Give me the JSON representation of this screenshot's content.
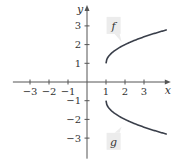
{
  "chart_data": {
    "type": "line",
    "title": "",
    "xlabel": "x",
    "ylabel": "y",
    "xlim": [
      -3.9,
      4.2
    ],
    "ylim": [
      -4.1,
      3.9
    ],
    "grid": false,
    "x_ticks": [
      -3,
      -2,
      -1,
      1,
      2,
      3
    ],
    "y_ticks": [
      3,
      2,
      1,
      -1,
      -2,
      -3
    ],
    "series": [
      {
        "name": "f",
        "formula": "1 + sqrt(x - 1)",
        "x": [
          1,
          1.1,
          1.25,
          1.5,
          2,
          2.5,
          3,
          3.5,
          4.2
        ],
        "values": [
          1,
          1.316,
          1.5,
          1.707,
          2,
          2.225,
          2.414,
          2.581,
          2.789
        ],
        "label_at": [
          1.4,
          3.0
        ]
      },
      {
        "name": "g",
        "formula": "-1 - sqrt(x - 1)",
        "x": [
          1,
          1.1,
          1.25,
          1.5,
          2,
          2.5,
          3,
          3.5,
          4.2
        ],
        "values": [
          -1,
          -1.316,
          -1.5,
          -1.707,
          -2,
          -2.225,
          -2.414,
          -2.581,
          -2.789
        ],
        "label_at": [
          1.4,
          -3.2
        ]
      }
    ],
    "color": "#3a3f4a"
  }
}
